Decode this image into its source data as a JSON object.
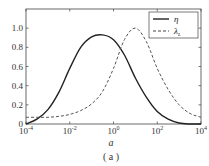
{
  "chart_data": {
    "type": "line",
    "title": "",
    "caption": "( a )",
    "xlabel": "a",
    "ylabel": "",
    "xscale": "log",
    "xlim": [
      0.0001,
      10000
    ],
    "ylim": [
      0,
      1.2
    ],
    "xticks": [
      "10^-4",
      "10^-2",
      "10^0",
      "10^2",
      "10^4"
    ],
    "yticks": [
      "0",
      "0.2",
      "0.4",
      "0.6",
      "0.8",
      "1.0"
    ],
    "grid": false,
    "legend_position": "upper right",
    "series": [
      {
        "name": "η",
        "style": "solid",
        "log10_x": [
          -4,
          -3.5,
          -3,
          -2.5,
          -2,
          -1.5,
          -1,
          -0.5,
          0,
          0.5,
          1,
          1.5,
          2,
          2.5,
          3,
          3.5,
          4
        ],
        "values": [
          0.0,
          0.05,
          0.15,
          0.33,
          0.58,
          0.8,
          0.91,
          0.93,
          0.88,
          0.72,
          0.48,
          0.28,
          0.13,
          0.05,
          0.01,
          0.0,
          0.0
        ]
      },
      {
        "name": "λ_L",
        "style": "dashed",
        "log10_x": [
          -4,
          -3.5,
          -3,
          -2.5,
          -2,
          -1.5,
          -1,
          -0.5,
          0,
          0.5,
          1,
          1.5,
          2,
          2.5,
          3,
          3.5,
          4
        ],
        "values": [
          0.07,
          0.07,
          0.07,
          0.08,
          0.1,
          0.14,
          0.21,
          0.34,
          0.58,
          0.88,
          1.0,
          0.86,
          0.58,
          0.36,
          0.2,
          0.11,
          0.07
        ]
      }
    ]
  },
  "labels": {
    "xlabel": "a",
    "caption": "( a )",
    "legend": [
      "η",
      "λ"
    ],
    "legend_sub": "L"
  }
}
